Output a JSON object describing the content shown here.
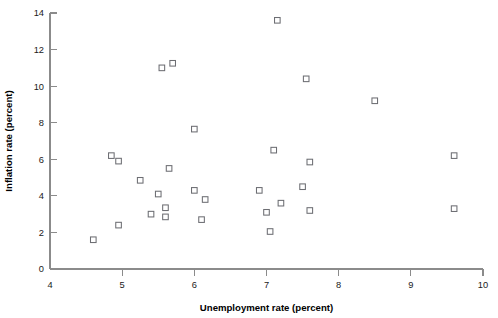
{
  "chart_data": {
    "type": "scatter",
    "title": "",
    "xlabel": "Unemployment rate (percent)",
    "ylabel": "Inflation rate (percent)",
    "xlim": [
      4,
      10
    ],
    "ylim": [
      0,
      14
    ],
    "xticks": [
      4,
      5,
      6,
      7,
      8,
      9,
      10
    ],
    "xticklabels": [
      "4",
      "5",
      "6",
      "7",
      "8",
      "9",
      "10"
    ],
    "yticks": [
      0,
      2,
      4,
      6,
      8,
      10,
      12,
      14
    ],
    "yticklabels": [
      "0",
      "2",
      "4",
      "6",
      "8",
      "10",
      "12",
      "14"
    ],
    "grid": false,
    "legend": null,
    "marker": "open-square",
    "marker_color": "#6d6e73",
    "axis_color": "#8b8b8b",
    "series": [
      {
        "name": "Unemployment vs inflation",
        "points": [
          {
            "x": 4.6,
            "y": 1.6
          },
          {
            "x": 4.85,
            "y": 6.2
          },
          {
            "x": 4.95,
            "y": 5.9
          },
          {
            "x": 4.95,
            "y": 2.4
          },
          {
            "x": 5.25,
            "y": 4.85
          },
          {
            "x": 5.4,
            "y": 3.0
          },
          {
            "x": 5.5,
            "y": 4.1
          },
          {
            "x": 5.55,
            "y": 11.0
          },
          {
            "x": 5.6,
            "y": 3.35
          },
          {
            "x": 5.6,
            "y": 2.85
          },
          {
            "x": 5.65,
            "y": 5.5
          },
          {
            "x": 5.7,
            "y": 11.25
          },
          {
            "x": 6.0,
            "y": 7.65
          },
          {
            "x": 6.0,
            "y": 4.3
          },
          {
            "x": 6.1,
            "y": 2.7
          },
          {
            "x": 6.15,
            "y": 3.8
          },
          {
            "x": 6.9,
            "y": 4.3
          },
          {
            "x": 7.0,
            "y": 3.1
          },
          {
            "x": 7.05,
            "y": 2.05
          },
          {
            "x": 7.1,
            "y": 6.5
          },
          {
            "x": 7.15,
            "y": 13.6
          },
          {
            "x": 7.2,
            "y": 3.6
          },
          {
            "x": 7.5,
            "y": 4.5
          },
          {
            "x": 7.55,
            "y": 10.4
          },
          {
            "x": 7.6,
            "y": 5.85
          },
          {
            "x": 7.6,
            "y": 3.2
          },
          {
            "x": 8.5,
            "y": 9.2
          },
          {
            "x": 9.6,
            "y": 6.2
          },
          {
            "x": 9.6,
            "y": 3.3
          }
        ]
      }
    ]
  }
}
